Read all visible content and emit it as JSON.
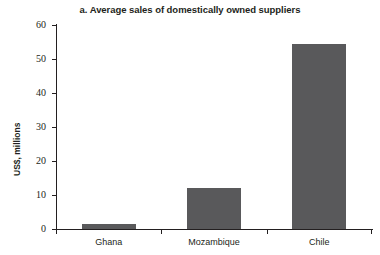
{
  "chart_data": {
    "type": "bar",
    "title": "a. Average sales of domestically owned suppliers",
    "xlabel": "",
    "ylabel": "US$, millions",
    "categories": [
      "Ghana",
      "Mozambique",
      "Chile"
    ],
    "values": [
      1.5,
      12,
      54.5
    ],
    "series": [
      {
        "name": "Average sales",
        "values": [
          1.5,
          12,
          54.5
        ]
      }
    ],
    "ylim": [
      0,
      60
    ],
    "yticks": [
      0,
      10,
      20,
      30,
      40,
      50,
      60
    ],
    "ytick_labels": [
      "0",
      "10",
      "20",
      "30",
      "40",
      "50",
      "60"
    ],
    "grid": false,
    "legend": false,
    "bar_color": "#59595b",
    "axis_color": "#231f20",
    "background_color": "#ffffff"
  }
}
